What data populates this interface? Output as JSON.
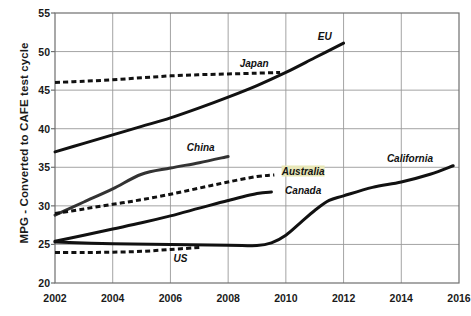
{
  "chart_data": {
    "type": "line",
    "title": "",
    "xlabel": "",
    "ylabel": "MPG - Converted to CAFE test cycle",
    "xlim": [
      2002,
      2016
    ],
    "ylim": [
      20,
      55
    ],
    "xticks": [
      2002,
      2004,
      2006,
      2008,
      2010,
      2012,
      2014,
      2016
    ],
    "yticks": [
      20,
      25,
      30,
      35,
      40,
      45,
      50,
      55
    ],
    "grid": true,
    "legend": "inline-labels",
    "series": [
      {
        "name": "EU",
        "style": "solid",
        "color": "#111111",
        "label_x": 2011.35,
        "label_y": 52.0,
        "x": [
          2002,
          2003,
          2004,
          2005,
          2006,
          2007,
          2008,
          2009,
          2010,
          2011,
          2012
        ],
        "y": [
          37.0,
          38.1,
          39.2,
          40.3,
          41.4,
          42.7,
          44.1,
          45.6,
          47.3,
          49.2,
          51.1
        ]
      },
      {
        "name": "Japan",
        "style": "dashed",
        "color": "#111111",
        "label_x": 2008.9,
        "label_y": 48.5,
        "x": [
          2002,
          2003,
          2004,
          2005,
          2006,
          2007,
          2008,
          2009,
          2009.8
        ],
        "y": [
          46.0,
          46.15,
          46.35,
          46.6,
          46.85,
          47.0,
          47.1,
          47.2,
          47.3
        ]
      },
      {
        "name": "China",
        "style": "solid",
        "color": "#333333",
        "label_x": 2007.05,
        "label_y": 37.6,
        "x": [
          2002,
          2003,
          2004,
          2005,
          2006,
          2007,
          2008
        ],
        "y": [
          28.8,
          30.5,
          32.2,
          34.1,
          34.9,
          35.6,
          36.4
        ]
      },
      {
        "name": "Australia",
        "style": "dashed",
        "color": "#111111",
        "label_x": 2010.6,
        "label_y": 34.5,
        "x": [
          2002,
          2003,
          2004,
          2005,
          2006,
          2007,
          2008,
          2009,
          2009.6
        ],
        "y": [
          29.0,
          29.6,
          30.2,
          30.8,
          31.5,
          32.3,
          33.1,
          33.8,
          34.0
        ]
      },
      {
        "name": "Canada",
        "style": "solid",
        "color": "#111111",
        "label_x": 2010.6,
        "label_y": 32.0,
        "x": [
          2002,
          2003,
          2004,
          2005,
          2006,
          2007,
          2008,
          2009,
          2009.5
        ],
        "y": [
          25.4,
          26.2,
          27.0,
          27.8,
          28.7,
          29.7,
          30.7,
          31.6,
          31.8
        ]
      },
      {
        "name": "California",
        "style": "solid",
        "color": "#111111",
        "label_x": 2014.3,
        "label_y": 36.2,
        "x": [
          2002,
          2004,
          2006,
          2008,
          2009,
          2009.5,
          2010,
          2010.5,
          2011,
          2011.5,
          2012,
          2013,
          2014,
          2015,
          2015.8
        ],
        "y": [
          25.3,
          25.1,
          25.0,
          24.9,
          24.85,
          25.2,
          26.2,
          27.8,
          29.4,
          30.7,
          31.3,
          32.4,
          33.1,
          34.1,
          35.2
        ]
      },
      {
        "name": "US",
        "style": "dashed",
        "color": "#111111",
        "label_x": 2006.35,
        "label_y": 23.3,
        "x": [
          2002,
          2003,
          2004,
          2005,
          2006,
          2007
        ],
        "y": [
          23.95,
          23.95,
          24.0,
          24.1,
          24.35,
          24.6
        ]
      }
    ]
  }
}
